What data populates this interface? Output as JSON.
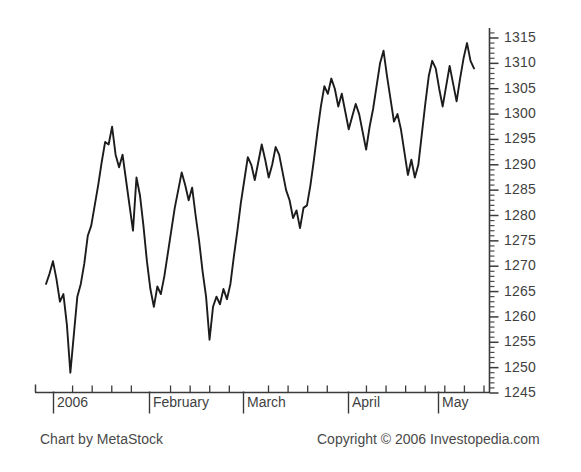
{
  "footer": {
    "chart_credit": "Chart by MetaStock",
    "copyright": "Copyright © 2006 Investopedia.com"
  },
  "chart_data": {
    "type": "line",
    "title": "",
    "subtitle": "",
    "xlabel": "",
    "ylabel": "",
    "grid": false,
    "legend": null,
    "legend_position": "none",
    "y_axis_position": "right",
    "line_color": "#1c1c1c",
    "background_color": "#ffffff",
    "ylim": [
      1245,
      1317
    ],
    "ytick_labels": [
      "1315",
      "1310",
      "1305",
      "1300",
      "1295",
      "1290",
      "1285",
      "1280",
      "1275",
      "1270",
      "1265",
      "1260",
      "1255",
      "1250",
      "1245"
    ],
    "ytick_values": [
      1315,
      1310,
      1305,
      1300,
      1295,
      1290,
      1285,
      1280,
      1275,
      1270,
      1265,
      1260,
      1255,
      1250,
      1245
    ],
    "minor_tick_step": 1,
    "xtick_labels": [
      "2006",
      "February",
      "March",
      "April",
      "May"
    ],
    "x_month_boundaries": [
      "2006",
      "February",
      "March",
      "April",
      "May"
    ],
    "x_weekly_ticks": 22,
    "series": [
      {
        "name": "S&P 500",
        "values": [
          1266.5,
          1268.5,
          1271.0,
          1267.5,
          1263.0,
          1264.5,
          1258.5,
          1249.0,
          1256.5,
          1264.0,
          1266.5,
          1270.5,
          1276.0,
          1278.0,
          1282.0,
          1286.0,
          1290.5,
          1294.5,
          1294.0,
          1297.5,
          1292.0,
          1289.5,
          1292.0,
          1287.0,
          1282.0,
          1277.0,
          1287.5,
          1284.0,
          1278.0,
          1271.0,
          1265.5,
          1262.0,
          1266.0,
          1264.5,
          1268.0,
          1272.5,
          1277.0,
          1281.5,
          1285.0,
          1288.5,
          1286.0,
          1283.0,
          1285.5,
          1280.0,
          1275.0,
          1269.0,
          1264.0,
          1255.5,
          1262.0,
          1264.0,
          1262.5,
          1265.5,
          1263.5,
          1266.5,
          1272.0,
          1277.0,
          1282.5,
          1287.0,
          1291.5,
          1290.0,
          1287.0,
          1290.5,
          1294.0,
          1291.0,
          1287.5,
          1290.0,
          1293.5,
          1292.0,
          1288.5,
          1285.0,
          1283.0,
          1279.5,
          1281.0,
          1277.5,
          1281.5,
          1282.0,
          1286.0,
          1291.0,
          1296.5,
          1301.5,
          1305.5,
          1304.0,
          1307.0,
          1305.0,
          1301.5,
          1304.0,
          1300.5,
          1297.0,
          1299.5,
          1302.0,
          1300.0,
          1296.5,
          1293.0,
          1297.5,
          1301.0,
          1305.5,
          1310.0,
          1312.5,
          1307.5,
          1303.0,
          1298.5,
          1300.0,
          1297.0,
          1292.5,
          1288.0,
          1291.0,
          1287.5,
          1290.0,
          1296.0,
          1302.0,
          1307.5,
          1310.5,
          1309.0,
          1305.0,
          1301.5,
          1305.5,
          1309.5,
          1306.0,
          1302.5,
          1307.0,
          1311.0,
          1314.0,
          1310.5,
          1309.0
        ]
      }
    ]
  }
}
